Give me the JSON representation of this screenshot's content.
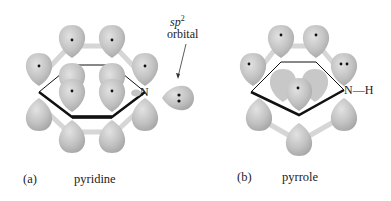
{
  "colors": {
    "lobe_fill": "#bdbdbd",
    "lobe_highlight": "#dadada",
    "lobe_shadow": "#9e9e9e",
    "bond": "#d9d9d9",
    "ring_line": "#111111",
    "text": "#222222"
  },
  "panel_a": {
    "label": "(a)",
    "name": "pyridine",
    "atom_label": "N",
    "annotation": {
      "line1_italic": "sp",
      "superscript": "2",
      "line2": "orbital"
    }
  },
  "panel_b": {
    "label": "(b)",
    "name": "pyrrole",
    "atom_label": "N",
    "bond_label": "—H"
  }
}
